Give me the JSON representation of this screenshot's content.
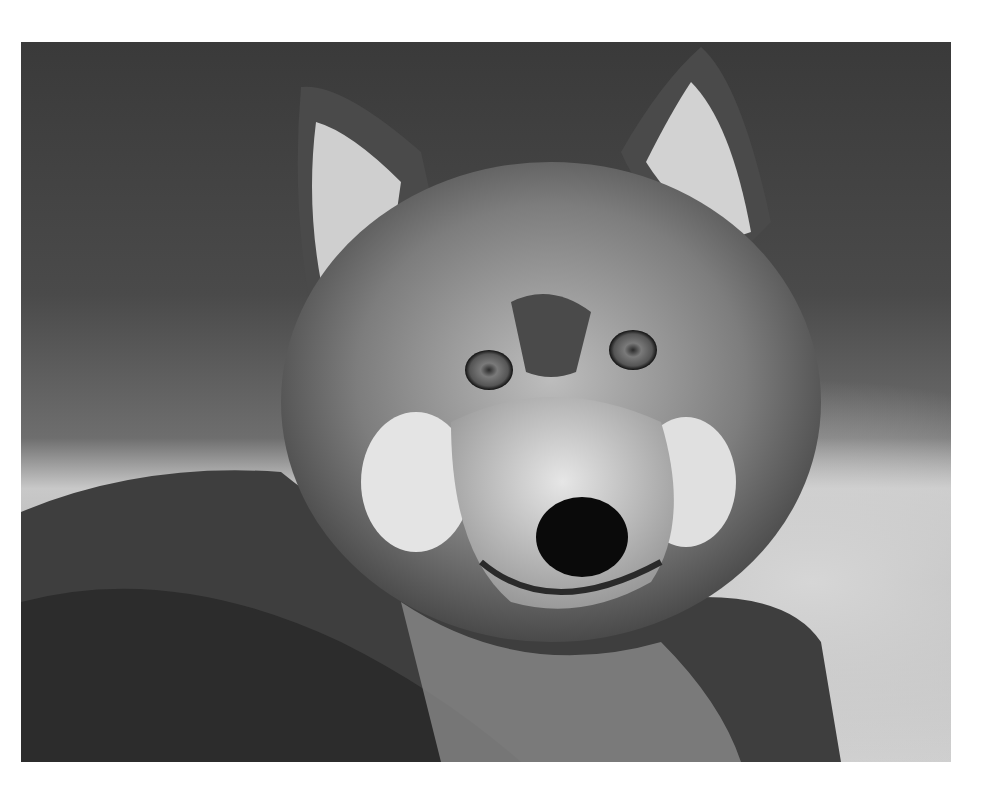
{
  "image": {
    "subject": "wolf-portrait",
    "style": "black-and-white photograph",
    "background_color": "#ffffff",
    "palette": {
      "bg_dark": "#3a3a3a",
      "bg_light": "#cfcfcf",
      "fur_dark": "#2a2a2a",
      "fur_mid": "#7a7a7a",
      "fur_light": "#d8d8d8",
      "nose": "#0a0a0a",
      "eye": "#6a6a6a"
    }
  }
}
